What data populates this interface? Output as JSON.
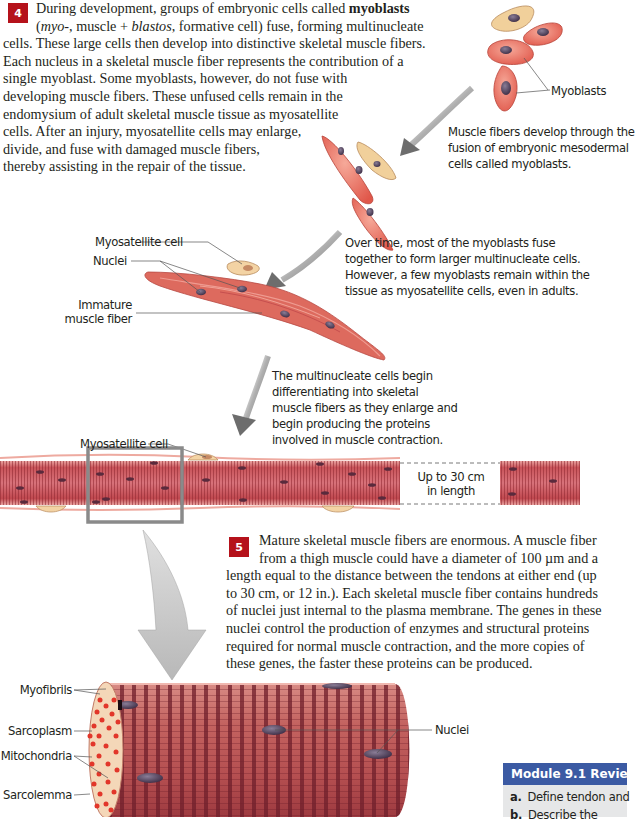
{
  "section4": {
    "badge": "4",
    "lines": [
      "During development, groups of embryonic cells called ",
      "(myo-, muscle + blastos, formative cell) fuse, forming multinucleate",
      "cells. These large cells then develop into distinctive skeletal muscle fibers.",
      "Each nucleus in a skeletal muscle fiber represents the contribution of a",
      "single myoblast. Some myoblasts, however, do not fuse with",
      "developing muscle fibers. These unfused cells remain in the",
      "endomysium of adult skeletal muscle tissue as myosatellite",
      "cells. After an injury, myosatellite cells may enlarge,",
      "divide, and fuse with damaged muscle fibers,",
      "thereby assisting in the repair of the tissue."
    ],
    "bold_term": "myoblasts",
    "line2_parts": {
      "open": "(",
      "myo": "myo-",
      "mid": ", muscle + ",
      "blastos": "blastos",
      "rest": ", formative cell) fuse, forming multinucleate"
    }
  },
  "section5": {
    "badge": "5",
    "lines": [
      "Mature skeletal muscle fibers are enormous. A muscle fiber",
      "from a thigh muscle could have a diameter of 100 µm and a",
      "length equal to the distance between the tendons at either end (up",
      "to 30 cm, or 12 in.). Each skeletal muscle fiber contains hundreds",
      "of nuclei just internal to the plasma membrane. The genes in these",
      "nuclei control the production of enzymes and structural proteins",
      "required for normal muscle contraction, and the more copies of",
      "these genes, the faster these proteins can be produced."
    ]
  },
  "captions": {
    "myoblasts": [
      "Muscle fibers develop through the",
      "fusion of embryonic mesodermal",
      "cells called myoblasts."
    ],
    "fusion": [
      "Over time, most of the myoblasts fuse",
      "together to form larger multinucleate cells.",
      "However, a few myoblasts remain within the",
      "tissue as myosatellite cells, even in adults."
    ],
    "differentiation": [
      "The multinucleate cells begin",
      "differentiating into skeletal",
      "muscle fibers as they enlarge and",
      "begin producing the proteins",
      "involved in muscle  contraction."
    ]
  },
  "labels": {
    "myoblasts": "Myoblasts",
    "myosatellite_cell_1": "Myosatellite cell",
    "nuclei_1": "Nuclei",
    "immature_fiber_1": "Immature",
    "immature_fiber_2": "muscle fiber",
    "myosatellite_cell_2": "Myosatellite cell",
    "length_1": "Up to 30 cm",
    "length_2": "in length",
    "myofibrils": "Myofibrils",
    "sarcoplasm": "Sarcoplasm",
    "mitochondria": "Mitochondria",
    "sarcolemma": "Sarcolemma",
    "nuclei_2": "Nuclei"
  },
  "review": {
    "title": "Module 9.1 Review",
    "items": [
      {
        "letter": "a.",
        "text": "Define tendon and"
      },
      {
        "letter": "b.",
        "text": "Describe the"
      }
    ]
  },
  "colors": {
    "badge_red": "#b5121b",
    "muscle_red": "#e0685f",
    "muscle_dark": "#a8323a",
    "satellite_tan": "#f3d3a4",
    "nucleus": "#4a3a52",
    "arrow_gray": "#8c8c8c",
    "review_blue": "#3b5aa3"
  }
}
